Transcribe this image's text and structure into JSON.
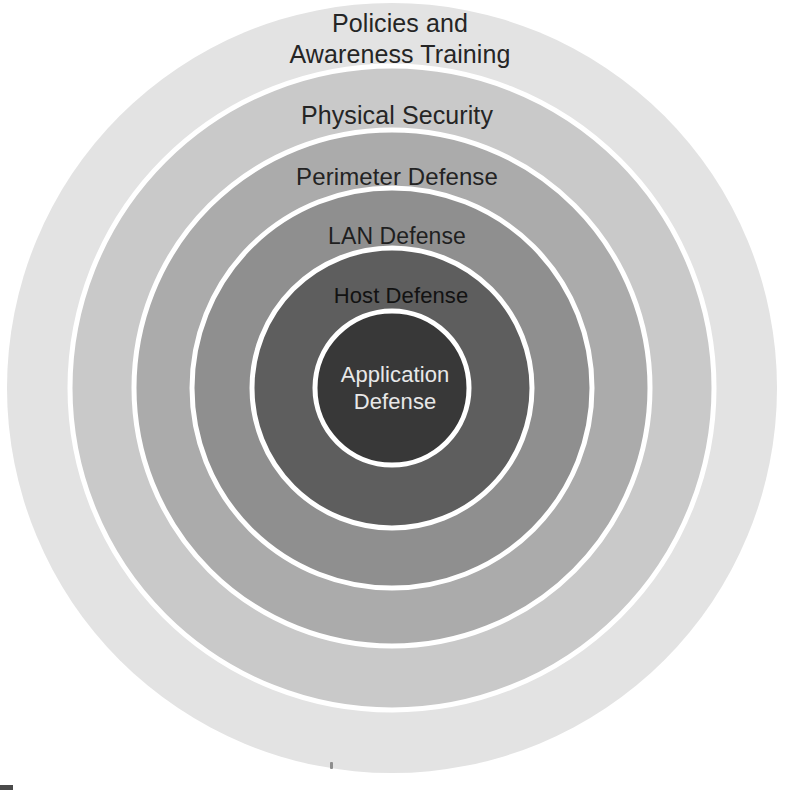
{
  "diagram": {
    "type": "concentric-circles",
    "canvas": {
      "width": 789,
      "height": 790,
      "background": "#ffffff"
    },
    "center": {
      "x": 392,
      "y": 388
    },
    "separator": {
      "color": "#ffffff",
      "width": 5
    },
    "layers": [
      {
        "id": "policies-and-awareness-training",
        "label": "Policies and\nAwareness Training",
        "order": 1,
        "position": "outermost",
        "radius": 385,
        "fill": "#e3e3e3",
        "text_color": "#252525",
        "font_size": 25,
        "label_left": 250,
        "label_top": 8,
        "label_width": 300
      },
      {
        "id": "physical-security",
        "label": "Physical Security",
        "order": 2,
        "radius": 322,
        "fill": "#c9c9c9",
        "text_color": "#252525",
        "font_size": 25,
        "label_left": 262,
        "label_top": 100,
        "label_width": 270
      },
      {
        "id": "perimeter-defense",
        "label": "Perimeter Defense",
        "order": 3,
        "radius": 258,
        "fill": "#ababab",
        "text_color": "#232323",
        "font_size": 24,
        "label_left": 262,
        "label_top": 162,
        "label_width": 270
      },
      {
        "id": "lan-defense",
        "label": "LAN Defense",
        "order": 4,
        "radius": 200,
        "fill": "#8f8f8f",
        "text_color": "#1f1f1f",
        "font_size": 23,
        "label_left": 282,
        "label_top": 222,
        "label_width": 230
      },
      {
        "id": "host-defense",
        "label": "Host Defense",
        "order": 5,
        "radius": 140,
        "fill": "#5e5e5e",
        "text_color": "#121212",
        "font_size": 22,
        "label_left": 286,
        "label_top": 283,
        "label_width": 230
      },
      {
        "id": "application-defense",
        "label": "Application\nDefense",
        "order": 6,
        "position": "innermost",
        "radius": 77,
        "fill": "#383838",
        "text_color": "#e8e8e8",
        "font_size": 22,
        "label_left": 302,
        "label_top": 362,
        "label_width": 186
      }
    ]
  }
}
